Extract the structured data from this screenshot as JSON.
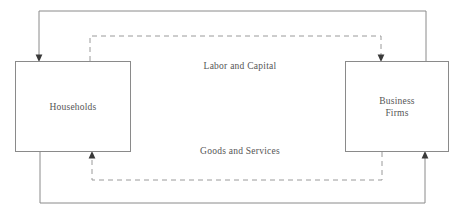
{
  "diagram": {
    "canvas": {
      "width": 464,
      "height": 217
    },
    "colors": {
      "line": "#8a8a8a",
      "dashed_line": "#9a9a9a",
      "text": "#555555",
      "background": "#ffffff",
      "box_border": "#8a8a8a"
    },
    "nodes": [
      {
        "id": "households",
        "label": "Households",
        "x": 15,
        "y": 61,
        "width": 116,
        "height": 91
      },
      {
        "id": "business-firms",
        "label": "Business\nFirms",
        "x": 345,
        "y": 61,
        "width": 104,
        "height": 91
      }
    ],
    "flows": [
      {
        "id": "labor-and-capital",
        "label": "Labor and Capital",
        "style": "dashed",
        "direction": "households-to-business-firms"
      },
      {
        "id": "goods-and-services",
        "label": "Goods and Services",
        "style": "dashed",
        "direction": "business-firms-to-households"
      },
      {
        "id": "payment-to-households",
        "label": "",
        "style": "solid",
        "direction": "business-firms-to-households"
      },
      {
        "id": "payment-to-business-firms",
        "label": "",
        "style": "solid",
        "direction": "households-to-business-firms"
      }
    ]
  }
}
